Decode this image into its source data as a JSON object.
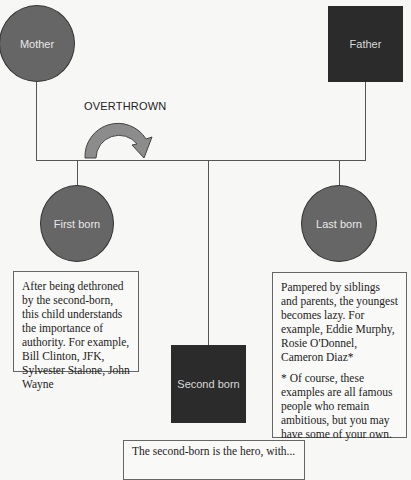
{
  "diagram": {
    "type": "birth-order family tree",
    "colors": {
      "female_node": "#666666",
      "male_node": "#2b2b2b",
      "arrow_fill": "#8c8c8c",
      "connector": "#555555"
    },
    "nodes": {
      "mother": {
        "label": "Mother",
        "shape": "circle"
      },
      "father": {
        "label": "Father",
        "shape": "square"
      },
      "first_born": {
        "label": "First born",
        "shape": "circle"
      },
      "last_born": {
        "label": "Last born",
        "shape": "circle"
      },
      "second_born": {
        "label": "Second born",
        "shape": "square"
      }
    },
    "arrow": {
      "label": "OVERTHROWN",
      "icon": "curved-arrow-icon"
    },
    "notes": {
      "first_born": {
        "text": "After being dethroned by the second-born, this child understands the importance of authority. For example, Bill Clinton, JFK, Sylvester Stalone, John Wayne"
      },
      "last_born": {
        "text": "Pampered by siblings and parents, the youngest becomes lazy. For example, Eddie Murphy, Rosie O'Donnel, Cameron Diaz*",
        "footnote": "* Of course, these examples are all famous people who remain ambitious, but you may have some of your own."
      },
      "second_born": {
        "text": "The second-born is the hero, with..."
      }
    }
  }
}
